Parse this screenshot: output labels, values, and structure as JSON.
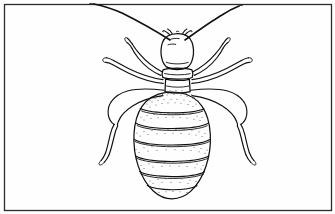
{
  "figure": {
    "kind": "line-drawing",
    "subject_label": "Termite worker, dorsal view",
    "title": "",
    "caption": "",
    "background_color": "#fefefe",
    "ink_color": "#111111",
    "frame": {
      "label": "Figure border",
      "color": "#2b2b2b",
      "x": 4,
      "y": 4,
      "width": 327,
      "height": 206,
      "stroke_width": 1.3
    },
    "parts": [
      {
        "name": "left-antenna",
        "label": "Left antenna"
      },
      {
        "name": "right-antenna",
        "label": "Right antenna"
      },
      {
        "name": "head",
        "label": "Head capsule"
      },
      {
        "name": "mandibles",
        "label": "Mandibles"
      },
      {
        "name": "pronotum",
        "label": "Pronotum"
      },
      {
        "name": "mesothorax",
        "label": "Mesothorax"
      },
      {
        "name": "abdomen",
        "label": "Abdomen"
      },
      {
        "name": "left-foreleg",
        "label": "Left foreleg"
      },
      {
        "name": "right-foreleg",
        "label": "Right foreleg"
      },
      {
        "name": "left-midleg",
        "label": "Left middle leg"
      },
      {
        "name": "right-midleg",
        "label": "Right middle leg"
      },
      {
        "name": "left-hindleg",
        "label": "Left hind leg"
      },
      {
        "name": "right-hindleg",
        "label": "Right hind leg"
      }
    ],
    "abdomen": {
      "segment_count": 7,
      "shading": "stipple"
    },
    "leg_count": 6,
    "antenna_count": 2
  }
}
